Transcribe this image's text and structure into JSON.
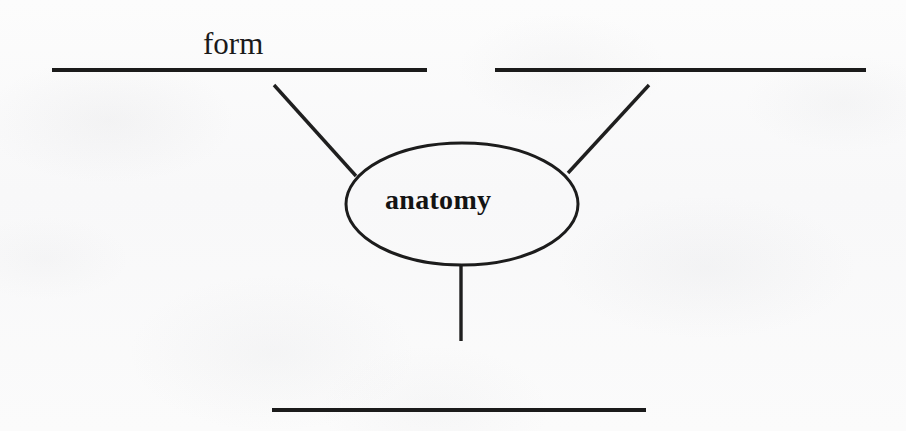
{
  "document": {
    "type": "concept-diagram-worksheet",
    "background_color": "#fbfbfb",
    "ink_color": "#1b1b1b",
    "width": 906,
    "height": 431
  },
  "diagram": {
    "center_node": {
      "label": "anatomy",
      "shape": "ellipse",
      "cx": 462,
      "cy": 204,
      "rx": 116,
      "ry": 61,
      "font_style": "bold-serif"
    },
    "branches": [
      {
        "id": "branch-upper-left",
        "answer_line": {
          "filled": true,
          "label": "form",
          "x1": 52,
          "y1": 70,
          "x2": 427,
          "y2": 70
        },
        "connector": {
          "x1": 274,
          "y1": 85,
          "x2": 356,
          "y2": 176
        }
      },
      {
        "id": "branch-upper-right",
        "answer_line": {
          "filled": false,
          "label": "",
          "x1": 495,
          "y1": 70,
          "x2": 866,
          "y2": 70
        },
        "connector": {
          "x1": 649,
          "y1": 85,
          "x2": 568,
          "y2": 173
        }
      },
      {
        "id": "branch-bottom",
        "answer_line": {
          "filled": false,
          "label": "",
          "x1": 272,
          "y1": 410,
          "x2": 646,
          "y2": 410
        },
        "connector": {
          "x1": 461,
          "y1": 264,
          "x2": 461,
          "y2": 341
        }
      }
    ],
    "labels": {
      "form": "form",
      "anatomy": "anatomy"
    }
  }
}
